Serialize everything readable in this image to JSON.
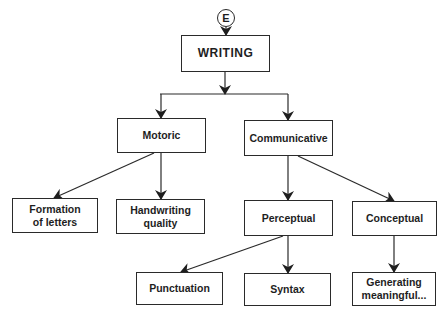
{
  "diagram": {
    "type": "hierarchy",
    "connector": {
      "label": "E"
    },
    "nodes": {
      "writing": {
        "label": "WRITING"
      },
      "motoric": {
        "label": "Motoric"
      },
      "communicative": {
        "label": "Communicative"
      },
      "formation": {
        "line1": "Formation",
        "line2": "of letters"
      },
      "handwriting": {
        "line1": "Handwriting",
        "line2": "quality"
      },
      "perceptual": {
        "label": "Perceptual"
      },
      "conceptual": {
        "label": "Conceptual"
      },
      "punctuation": {
        "label": "Punctuation"
      },
      "syntax": {
        "label": "Syntax"
      },
      "generating": {
        "line1": "Generating",
        "line2": "meaningful..."
      }
    },
    "edges": [
      [
        "E",
        "WRITING"
      ],
      [
        "WRITING",
        "Motoric"
      ],
      [
        "WRITING",
        "Communicative"
      ],
      [
        "Motoric",
        "Formation of letters"
      ],
      [
        "Motoric",
        "Handwriting quality"
      ],
      [
        "Communicative",
        "Perceptual"
      ],
      [
        "Communicative",
        "Conceptual"
      ],
      [
        "Perceptual",
        "Punctuation"
      ],
      [
        "Perceptual",
        "Syntax"
      ],
      [
        "Conceptual",
        "Generating meaningful..."
      ]
    ],
    "colors": {
      "line": "#2a2a2a",
      "text": "#1e1e1e",
      "background": "#ffffff"
    }
  }
}
